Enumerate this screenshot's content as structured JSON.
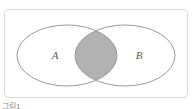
{
  "diagram": {
    "type": "venn",
    "label_a": "A",
    "label_b": "B",
    "colors": {
      "panel_border": "#d9d9d9",
      "panel_fill": "#ffffff",
      "ellipse_stroke": "#999999",
      "intersection_fill": "#b2b2b2",
      "label_color": "#5a5a5a"
    }
  },
  "caption": {
    "text": "그림1"
  }
}
